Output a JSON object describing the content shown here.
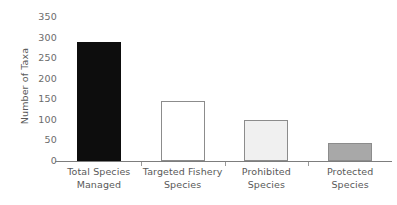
{
  "chart_data": {
    "type": "bar",
    "title": "",
    "subtitle": "",
    "xlabel": "",
    "ylabel": "Number of Taxa",
    "ylim": [
      0,
      350
    ],
    "yticks": [
      0,
      50,
      100,
      150,
      200,
      250,
      300,
      350
    ],
    "ytick_labels": [
      "0",
      "50",
      "100",
      "150",
      "200",
      "250",
      "300",
      "350"
    ],
    "grid": false,
    "legend": null,
    "categories": [
      "Total Species Managed",
      "Targeted Fishery Species",
      "Prohibited Species",
      "Protected Species"
    ],
    "category_lines": [
      [
        "Total Species",
        "Managed"
      ],
      [
        "Targeted Fishery",
        "Species"
      ],
      [
        "Prohibited",
        "Species"
      ],
      [
        "Protected",
        "Species"
      ]
    ],
    "values": [
      290,
      147,
      100,
      43
    ],
    "bar_colors": [
      "#0d0d0d",
      "#ffffff",
      "#f0f0f0",
      "#a8a8a8"
    ],
    "bar_edge_colors": [
      "#0d0d0d",
      "#8c8c8c",
      "#8c8c8c",
      "#8c8c8c"
    ],
    "axis_color": "#7d7d7d",
    "tick_label_color": "#6b6b6b",
    "axis_title_color": "#595959",
    "background": "#ffffff"
  }
}
